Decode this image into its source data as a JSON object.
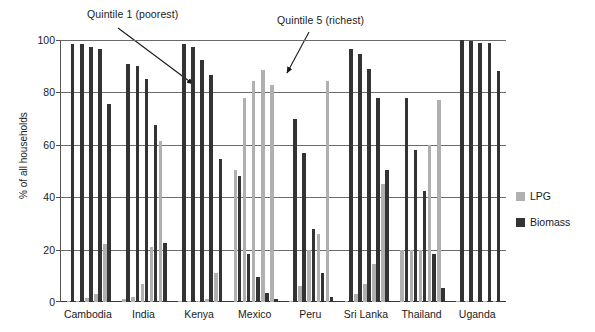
{
  "chart_data": {
    "type": "bar",
    "title": "",
    "xlabel": "",
    "ylabel": "% of all households",
    "ylim": [
      0,
      100
    ],
    "yticks": [
      0,
      20,
      40,
      60,
      80,
      100
    ],
    "grid": true,
    "legend_position": "right",
    "categories": [
      "Cambodia",
      "India",
      "Kenya",
      "Mexico",
      "Peru",
      "Sri Lanka",
      "Thailand",
      "Uganda"
    ],
    "subgroups": [
      "Quintile 1",
      "Quintile 2",
      "Quintile 3",
      "Quintile 4",
      "Quintile 5"
    ],
    "series": [
      {
        "name": "LPG",
        "color": "#b0b0b0",
        "values": [
          [
            0.3,
            0.5,
            1.5,
            3.0,
            22.0
          ],
          [
            1.0,
            2.0,
            7.0,
            21.0,
            61.5
          ],
          [
            0.3,
            0.3,
            0.5,
            1.0,
            11.0
          ],
          [
            50.5,
            78.0,
            84.5,
            88.5,
            83.0
          ],
          [
            0.5,
            6.0,
            20.0,
            26.0,
            84.5
          ],
          [
            0.5,
            3.0,
            7.0,
            14.5,
            45.0
          ],
          [
            20.0,
            20.0,
            20.0,
            60.0,
            77.0
          ],
          [
            0.3,
            0.3,
            0.3,
            0.5,
            0.5
          ]
        ]
      },
      {
        "name": "Biomass",
        "color": "#333333",
        "values": [
          [
            98.5,
            98.5,
            97.5,
            96.5,
            75.5
          ],
          [
            91.0,
            90.0,
            85.0,
            67.5,
            22.5
          ],
          [
            98.5,
            97.5,
            92.5,
            86.5,
            54.5
          ],
          [
            48.0,
            18.5,
            9.5,
            3.5,
            1.0
          ],
          [
            70.0,
            57.0,
            28.0,
            11.0,
            2.0
          ],
          [
            96.5,
            94.5,
            89.0,
            78.0,
            50.5
          ],
          [
            78.0,
            58.0,
            42.5,
            18.5,
            5.5
          ],
          [
            100.0,
            99.5,
            99.0,
            99.0,
            88.0
          ]
        ]
      }
    ],
    "annotations": [
      {
        "text": "Quintile 1 (poorest)",
        "points_to": "first-quintile-bar"
      },
      {
        "text": "Quintile 5 (richest)",
        "points_to": "fifth-quintile-bar"
      }
    ]
  },
  "legend": {
    "items": [
      {
        "label": "LPG",
        "color": "#b0b0b0"
      },
      {
        "label": "Biomass",
        "color": "#333333"
      }
    ]
  }
}
